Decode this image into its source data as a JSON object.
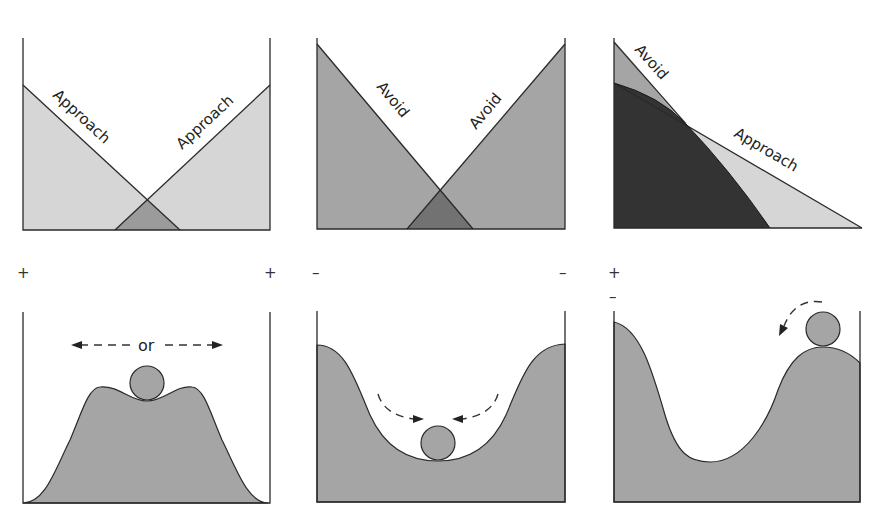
{
  "colors": {
    "light_fill": "#d6d6d6",
    "medium_fill": "#a5a5a5",
    "overlap_light": "#9b9b9b",
    "overlap_medium": "#727272",
    "dark_fill": "#333333",
    "line": "#2a2a2a",
    "ball_fill": "#a5a5a5"
  },
  "top_row": [
    {
      "id": "approach-approach",
      "left_label": "Approach",
      "right_label": "Approach",
      "left_sign": "+",
      "right_sign": "+"
    },
    {
      "id": "avoid-avoid",
      "left_label": "Avoid",
      "right_label": "Avoid",
      "left_sign": "–",
      "right_sign": "–"
    },
    {
      "id": "approach-avoid",
      "avoid_label": "Avoid",
      "approach_label": "Approach",
      "sign_plus": "+",
      "sign_minus": "–"
    }
  ],
  "bottom_row": [
    {
      "id": "unstable-equilibrium",
      "arrow_label": "or"
    },
    {
      "id": "stable-equilibrium"
    },
    {
      "id": "ambivalent-equilibrium"
    }
  ]
}
